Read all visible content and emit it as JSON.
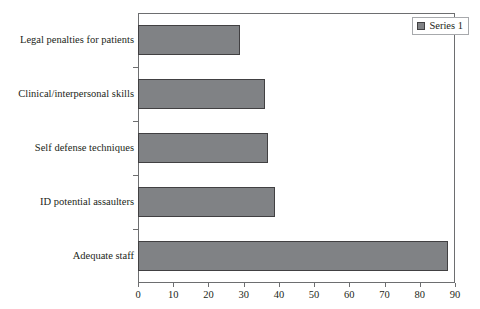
{
  "chart_data": {
    "type": "bar",
    "orientation": "horizontal",
    "title": "",
    "xlabel": "",
    "ylabel": "",
    "categories": [
      "Legal penalties for patients",
      "Clinical/interpersonal skills",
      "Self defense techniques",
      "ID potential assaulters",
      "Adequate staff"
    ],
    "values": [
      29,
      36,
      37,
      39,
      88
    ],
    "series": [
      {
        "name": "Series 1",
        "values": [
          29,
          36,
          37,
          39,
          88
        ],
        "color": "#808285"
      }
    ],
    "xlim": [
      0,
      90
    ],
    "xticks": [
      0,
      10,
      20,
      30,
      40,
      50,
      60,
      70,
      80,
      90
    ],
    "xtick_labels": [
      "0",
      "10",
      "20",
      "30",
      "40",
      "50",
      "60",
      "70",
      "80",
      "90"
    ],
    "grid": false,
    "legend": {
      "position": "top-right",
      "entries": [
        "Series 1"
      ]
    }
  },
  "legend": {
    "label": "Series 1"
  },
  "colors": {
    "bar_fill": "#808285",
    "bar_border": "#414042",
    "axis": "#6d6e70",
    "text": "#231f20",
    "background": "#ffffff"
  }
}
